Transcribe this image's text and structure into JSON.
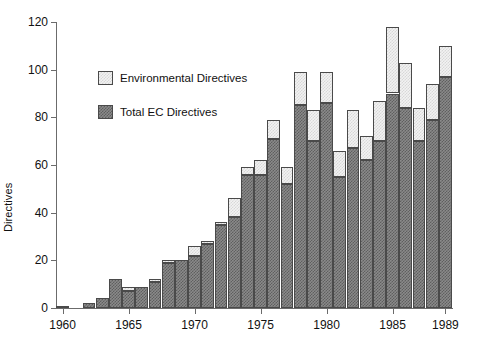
{
  "chart_data": {
    "type": "bar",
    "subtype": "stacked-vertical",
    "title": "",
    "xlabel": "",
    "ylabel": "Directives",
    "ylim": [
      0,
      120
    ],
    "yticks": [
      0,
      20,
      40,
      60,
      80,
      100,
      120
    ],
    "xlim": [
      1960,
      1989
    ],
    "xticks": [
      1960,
      1965,
      1970,
      1975,
      1980,
      1985,
      1989
    ],
    "xtick_labels": [
      "1960",
      "1965",
      "1970",
      "1975",
      "1980",
      "1985",
      "1989"
    ],
    "grid": false,
    "legend_position": "upper-left-inside",
    "categories": [
      1960,
      1961,
      1962,
      1963,
      1964,
      1965,
      1966,
      1967,
      1968,
      1969,
      1970,
      1971,
      1972,
      1973,
      1974,
      1975,
      1976,
      1977,
      1978,
      1979,
      1980,
      1981,
      1982,
      1983,
      1984,
      1985,
      1986,
      1987,
      1988,
      1989
    ],
    "series": [
      {
        "name": "Total EC Directives",
        "color": "#7a7a7a",
        "values": [
          1,
          0,
          2,
          4,
          12,
          7,
          9,
          11,
          19,
          20,
          22,
          27,
          35,
          38,
          56,
          56,
          71,
          52,
          85,
          70,
          86,
          55,
          67,
          62,
          70,
          90,
          84,
          70,
          79,
          97
        ]
      },
      {
        "name": "Environmental Directives",
        "color": "#ececec",
        "values": [
          0,
          0,
          0,
          0,
          0,
          2,
          0,
          1,
          1,
          0,
          4,
          1,
          1,
          8,
          3,
          6,
          8,
          7,
          14,
          13,
          13,
          11,
          16,
          10,
          17,
          28,
          19,
          14,
          15,
          13
        ]
      }
    ],
    "totals": [
      1,
      0,
      2,
      4,
      12,
      9,
      9,
      12,
      20,
      20,
      26,
      28,
      36,
      46,
      59,
      62,
      79,
      59,
      99,
      83,
      99,
      66,
      83,
      72,
      87,
      118,
      103,
      84,
      94,
      110
    ]
  },
  "legend": {
    "items": [
      {
        "label": "Environmental Directives",
        "style": "light-checker"
      },
      {
        "label": "Total EC Directives",
        "style": "dark-checker"
      }
    ]
  },
  "axes": {
    "y_axis_title": "Directives",
    "y_tick_labels": [
      "0",
      "20",
      "40",
      "60",
      "80",
      "100",
      "120"
    ],
    "x_tick_labels": [
      "1960",
      "1965",
      "1970",
      "1975",
      "1980",
      "1985",
      "1989"
    ]
  }
}
